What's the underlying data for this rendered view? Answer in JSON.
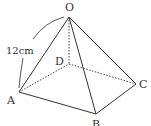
{
  "diagram": {
    "type": "square-pyramid",
    "vertices": {
      "O": {
        "label": "O",
        "x": 69,
        "y": 17
      },
      "A": {
        "label": "A",
        "x": 19,
        "y": 92
      },
      "B": {
        "label": "B",
        "x": 96,
        "y": 114
      },
      "C": {
        "label": "C",
        "x": 136,
        "y": 84
      },
      "D": {
        "label": "D",
        "x": 69,
        "y": 64
      }
    },
    "measurement": {
      "edge": "OA",
      "label": "12cm"
    },
    "solid_edges": [
      "OA",
      "OB",
      "OC",
      "AB",
      "BC"
    ],
    "hidden_edges": [
      "OD",
      "AD",
      "DC"
    ],
    "line_color": "#333333"
  }
}
